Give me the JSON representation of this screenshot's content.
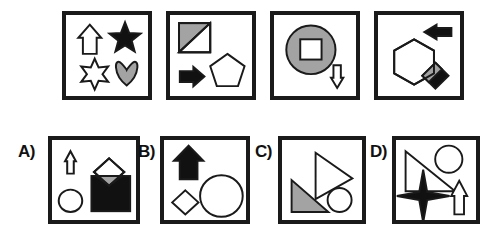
{
  "canvas": {
    "width": 491,
    "height": 241,
    "background": "#ffffff"
  },
  "style": {
    "stroke": "#1a1a1a",
    "fill_black": "#111111",
    "fill_white": "#ffffff",
    "fill_gray": "#a3a3a3",
    "panel_border": "#1a1a1a",
    "panel_border_width": 4
  },
  "puzzle": {
    "type": "visual-analogy-matrix",
    "prompt_row": {
      "count": 4,
      "panels": [
        {
          "index": 1,
          "name": "prompt-panel-1",
          "x": 62,
          "y": 11,
          "w": 90,
          "h": 89,
          "shapes": [
            {
              "shape": "up-arrow",
              "fill": "white",
              "outline": "black"
            },
            {
              "shape": "five-point-star",
              "fill": "black",
              "outline": "black"
            },
            {
              "shape": "six-point-star",
              "fill": "white",
              "outline": "black"
            },
            {
              "shape": "heart",
              "fill": "gray",
              "outline": "black"
            }
          ]
        },
        {
          "index": 2,
          "name": "prompt-panel-2",
          "x": 166,
          "y": 11,
          "w": 90,
          "h": 89,
          "shapes": [
            {
              "shape": "square-with-diagonal",
              "fill": "gray-half",
              "outline": "black"
            },
            {
              "shape": "right-arrow",
              "fill": "black",
              "outline": "black"
            },
            {
              "shape": "pentagon",
              "fill": "white",
              "outline": "black"
            }
          ]
        },
        {
          "index": 3,
          "name": "prompt-panel-3",
          "x": 270,
          "y": 11,
          "w": 90,
          "h": 89,
          "shapes": [
            {
              "shape": "circle",
              "fill": "gray",
              "outline": "black"
            },
            {
              "shape": "square",
              "fill": "white",
              "outline": "black"
            },
            {
              "shape": "down-arrow",
              "fill": "white",
              "outline": "black"
            }
          ]
        },
        {
          "index": 4,
          "name": "prompt-panel-4",
          "x": 374,
          "y": 11,
          "w": 90,
          "h": 89,
          "shapes": [
            {
              "shape": "left-arrow",
              "fill": "black",
              "outline": "black"
            },
            {
              "shape": "hexagon",
              "fill": "white",
              "outline": "black"
            },
            {
              "shape": "diamond",
              "fill": "black",
              "outline": "black"
            },
            {
              "shape": "overlap-sliver",
              "fill": "gray",
              "outline": "black"
            }
          ]
        }
      ]
    },
    "answer_row": {
      "count": 4,
      "options": [
        {
          "key": "A",
          "label": "A)",
          "name": "answer-option-a",
          "label_x": 18,
          "label_y": 143,
          "x": 48,
          "y": 136,
          "w": 92,
          "h": 88,
          "shapes": [
            {
              "shape": "thin-up-arrow",
              "fill": "white",
              "outline": "black"
            },
            {
              "shape": "circle",
              "fill": "white",
              "outline": "black"
            },
            {
              "shape": "square",
              "fill": "black",
              "outline": "black"
            },
            {
              "shape": "diamond",
              "fill": "white",
              "outline": "black"
            },
            {
              "shape": "overlap-sliver",
              "fill": "gray",
              "outline": "black"
            }
          ]
        },
        {
          "key": "B",
          "label": "B)",
          "name": "answer-option-b",
          "label_x": 138,
          "label_y": 143,
          "x": 160,
          "y": 136,
          "w": 90,
          "h": 88,
          "shapes": [
            {
              "shape": "up-arrow",
              "fill": "black",
              "outline": "black"
            },
            {
              "shape": "diamond",
              "fill": "white",
              "outline": "black"
            },
            {
              "shape": "circle",
              "fill": "white",
              "outline": "black"
            }
          ]
        },
        {
          "key": "C",
          "label": "C)",
          "name": "answer-option-c",
          "label_x": 255,
          "label_y": 143,
          "x": 278,
          "y": 136,
          "w": 88,
          "h": 88,
          "shapes": [
            {
              "shape": "right-triangle-outline",
              "fill": "white",
              "outline": "black"
            },
            {
              "shape": "right-triangle",
              "fill": "gray",
              "outline": "black"
            },
            {
              "shape": "circle",
              "fill": "white",
              "outline": "black"
            }
          ]
        },
        {
          "key": "D",
          "label": "D)",
          "name": "answer-option-d",
          "label_x": 370,
          "label_y": 143,
          "x": 392,
          "y": 136,
          "w": 88,
          "h": 88,
          "shapes": [
            {
              "shape": "right-triangle-outline",
              "fill": "white",
              "outline": "black"
            },
            {
              "shape": "circle",
              "fill": "white",
              "outline": "black"
            },
            {
              "shape": "four-point-star",
              "fill": "black",
              "outline": "black"
            },
            {
              "shape": "up-arrow",
              "fill": "white",
              "outline": "black"
            }
          ]
        }
      ]
    }
  }
}
